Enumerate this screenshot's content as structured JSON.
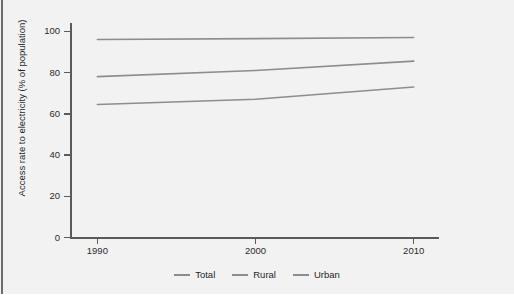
{
  "chart_data": {
    "type": "line",
    "title": "",
    "xlabel": "",
    "ylabel": "Access rate to electricity (% of population)",
    "x": [
      1990,
      2000,
      2010
    ],
    "xlim": [
      1988.3,
      2011.6
    ],
    "ylim": [
      0,
      104
    ],
    "xticks": [
      "1990",
      "2000",
      "2010"
    ],
    "yticks": [
      "0",
      "20",
      "40",
      "60",
      "80",
      "100"
    ],
    "grid": false,
    "legend_position": "bottom",
    "line_color": "#8d8d8d",
    "axis_color": "#5a5a5a",
    "background_color": "#f2f2f2",
    "series": [
      {
        "name": "Total",
        "values": [
          78,
          81,
          85.5
        ]
      },
      {
        "name": "Rural",
        "values": [
          64.5,
          67,
          73
        ]
      },
      {
        "name": "Urban",
        "values": [
          96,
          96.4,
          97
        ]
      }
    ]
  },
  "axes": {
    "y_title": "Access rate to electricity (% of population)",
    "y_ticks": [
      {
        "label": "100",
        "value": 100
      },
      {
        "label": "80",
        "value": 80
      },
      {
        "label": "60",
        "value": 60
      },
      {
        "label": "40",
        "value": 40
      },
      {
        "label": "20",
        "value": 20
      },
      {
        "label": "0",
        "value": 0
      }
    ],
    "x_ticks": [
      {
        "label": "1990",
        "value": 1990
      },
      {
        "label": "2000",
        "value": 2000
      },
      {
        "label": "2010",
        "value": 2010
      }
    ]
  },
  "legend": {
    "items": [
      {
        "label": "Total",
        "color": "#8d8d8d"
      },
      {
        "label": "Rural",
        "color": "#8d8d8d"
      },
      {
        "label": "Urban",
        "color": "#8d8d8d"
      }
    ]
  }
}
